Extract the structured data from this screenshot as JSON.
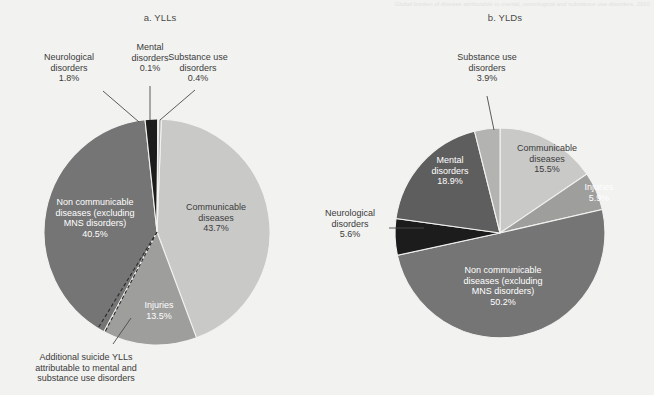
{
  "figure": {
    "cut_title": "Global burden of disease attributable to mental, neurological and substance use disorders, 2010",
    "panel_a_title": "a. YLLs",
    "panel_b_title": "b. YLDs"
  },
  "colors": {
    "communicable": "#c9c9c8",
    "non_communicable": "#757575",
    "injuries": "#9e9e9d",
    "mental": "#5e5e5e",
    "neurological": "#1c1c1c",
    "substance_use": "#b3b3b2",
    "background": "#f2f2f0",
    "text": "#3b3b3b",
    "text_on_dark": "#ffffff",
    "leader_line": "#4a4a4a"
  },
  "chart_data": [
    {
      "type": "pie",
      "title": "a. YLLs",
      "id": "ylls",
      "unit": "%",
      "legend": "none",
      "slices": [
        {
          "label": "Communicable diseases",
          "value": 43.7,
          "value_text": "43.7%",
          "color": "#c9c9c8",
          "label_placement": "inside"
        },
        {
          "label": "Injuries",
          "value": 13.5,
          "value_text": "13.5%",
          "color": "#9e9e9d",
          "label_placement": "inside"
        },
        {
          "label": "Non communicable diseases (excluding MNS disorders)",
          "value": 40.5,
          "value_text": "40.5%",
          "color": "#757575",
          "label_placement": "inside"
        },
        {
          "label": "Neurological disorders",
          "value": 1.8,
          "value_text": "1.8%",
          "color": "#1c1c1c",
          "label_placement": "outside"
        },
        {
          "label": "Mental disorders",
          "value": 0.1,
          "value_text": "0.1%",
          "color": "#5e5e5e",
          "label_placement": "outside"
        },
        {
          "label": "Substance use disorders",
          "value": 0.4,
          "value_text": "0.4%",
          "color": "#b3b3b2",
          "label_placement": "outside"
        }
      ],
      "annotation": "Additional suicide YLLs attributable to mental and substance use disorders"
    },
    {
      "type": "pie",
      "title": "b. YLDs",
      "id": "ylds",
      "unit": "%",
      "legend": "none",
      "slices": [
        {
          "label": "Communicable diseases",
          "value": 15.5,
          "value_text": "15.5%",
          "color": "#c9c9c8",
          "label_placement": "inside"
        },
        {
          "label": "Injuries",
          "value": 5.9,
          "value_text": "5.9%",
          "color": "#9e9e9d",
          "label_placement": "inside"
        },
        {
          "label": "Non communicable diseases (excluding MNS disorders)",
          "value": 50.2,
          "value_text": "50.2%",
          "color": "#757575",
          "label_placement": "inside"
        },
        {
          "label": "Neurological disorders",
          "value": 5.6,
          "value_text": "5.6%",
          "color": "#1c1c1c",
          "label_placement": "outside"
        },
        {
          "label": "Mental disorders",
          "value": 18.9,
          "value_text": "18.9%",
          "color": "#5e5e5e",
          "label_placement": "inside"
        },
        {
          "label": "Substance use disorders",
          "value": 3.9,
          "value_text": "3.9%",
          "color": "#b3b3b2",
          "label_placement": "outside"
        }
      ]
    }
  ],
  "labels_a": {
    "neurological": {
      "name": "Neurological\ndisorders",
      "value": "1.8%"
    },
    "mental": {
      "name": "Mental\ndisorders",
      "value": "0.1%"
    },
    "substance": {
      "name": "Substance use\ndisorders",
      "value": "0.4%"
    },
    "noncommunicable": {
      "name": "Non communicable\ndiseases (excluding\nMNS disorders)",
      "value": "40.5%"
    },
    "communicable": {
      "name": "Communicable\ndiseases",
      "value": "43.7%"
    },
    "injuries": {
      "name": "Injuries",
      "value": "13.5%"
    },
    "annotation": "Additional suicide YLLs\nattributable to mental and\nsubstance use disorders"
  },
  "labels_b": {
    "substance": {
      "name": "Substance use\ndisorders",
      "value": "3.9%"
    },
    "communicable": {
      "name": "Communicable\ndiseases",
      "value": "15.5%"
    },
    "injuries": {
      "name": "Injuries",
      "value": "5.9%"
    },
    "mental": {
      "name": "Mental\ndisorders",
      "value": "18.9%"
    },
    "neurological": {
      "name": "Neurological\ndisorders",
      "value": "5.6%"
    },
    "noncommunicable": {
      "name": "Non communicable\ndiseases (excluding\nMNS disorders)",
      "value": "50.2%"
    }
  }
}
